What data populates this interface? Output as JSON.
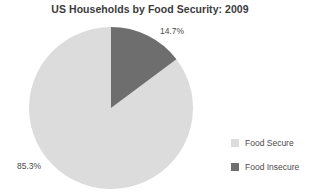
{
  "chart_data": {
    "type": "pie",
    "title": "US Households by Food Security: 2009",
    "xlabel": "",
    "ylabel": "",
    "legend_position": "right",
    "grid": false,
    "categories": [
      "Food Secure",
      "Food Insecure"
    ],
    "values": [
      85.3,
      14.7
    ],
    "slices": [
      {
        "label": "Food Secure",
        "value": 85.3,
        "data_label": "85.3%",
        "color": "#dcdcdc"
      },
      {
        "label": "Food Insecure",
        "value": 14.7,
        "data_label": "14.7%",
        "color": "#6e6e6e"
      }
    ],
    "legend": [
      {
        "label": "Food Secure",
        "color": "#dcdcdc"
      },
      {
        "label": "Food Insecure",
        "color": "#6e6e6e"
      }
    ]
  },
  "geometry": {
    "start_angle_deg": 0,
    "direction": "clockwise"
  }
}
